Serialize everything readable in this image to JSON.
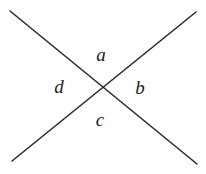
{
  "figure": {
    "width": 206,
    "height": 174,
    "background_color": "#ffffff",
    "line_color": "#2b2b2b",
    "line_width": 1.6,
    "label_color": "#1c1c1c",
    "lines": [
      {
        "name": "line-top-left-to-bottom-right",
        "x1": 10,
        "y1": 11,
        "x2": 197,
        "y2": 164
      },
      {
        "name": "line-top-right-to-bottom-left",
        "x1": 196,
        "y1": 12,
        "x2": 12,
        "y2": 161
      }
    ],
    "intersection": {
      "x": 102,
      "y": 87
    },
    "labels": [
      {
        "id": "a",
        "text": "a",
        "position": "top",
        "x": 101,
        "y": 54
      },
      {
        "id": "b",
        "text": "b",
        "position": "right",
        "x": 140,
        "y": 87
      },
      {
        "id": "c",
        "text": "c",
        "position": "bottom",
        "x": 100,
        "y": 119
      },
      {
        "id": "d",
        "text": "d",
        "position": "left",
        "x": 59,
        "y": 86
      }
    ]
  }
}
